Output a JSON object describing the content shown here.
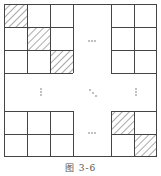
{
  "figure": {
    "caption": "图 3-6",
    "ellipsis_horizontal": "…",
    "ellipsis_vertical": "⋮",
    "ellipsis_diagonal": "⋱",
    "shaded_cells_top_left": [
      [
        0,
        0
      ],
      [
        1,
        1
      ],
      [
        2,
        2
      ]
    ],
    "shaded_cells_bottom_right": [
      [
        0,
        0
      ],
      [
        1,
        1
      ]
    ],
    "line_color": "#444444",
    "hatch_color": "#555555"
  }
}
